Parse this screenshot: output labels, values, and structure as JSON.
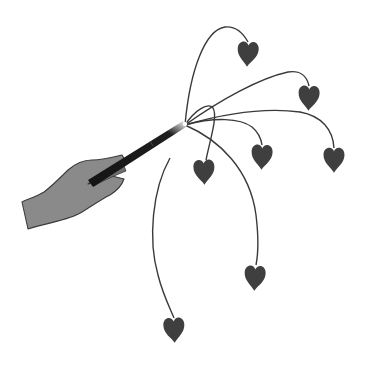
{
  "illustration": {
    "description": "Hand holding a magic wand from which curved strings fan out, each ending in a dangling heart",
    "colors": {
      "background": "#ffffff",
      "hand": "#8a8a8a",
      "hand_outline": "#3a3a3a",
      "wand": "#141414",
      "string": "#3a3a3a",
      "heart": "#3f3f3f"
    },
    "heart_count": 8
  }
}
